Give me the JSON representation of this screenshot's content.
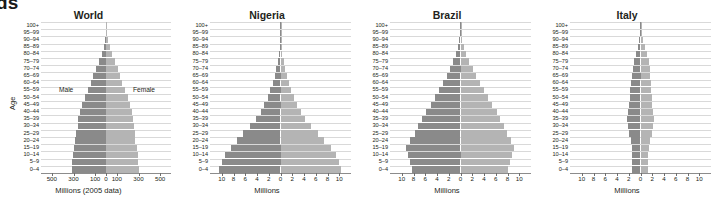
{
  "crop_fragment": "ds",
  "axis": {
    "y_title": "Age",
    "age_groups": [
      "100+",
      "95–99",
      "90–94",
      "85–89",
      "80–84",
      "75–79",
      "70–74",
      "65–69",
      "60–64",
      "55–59",
      "50–54",
      "45–49",
      "40–44",
      "35–39",
      "30–34",
      "25–29",
      "20–24",
      "15–19",
      "10–14",
      "5–9",
      "0–4"
    ]
  },
  "annotations": {
    "male": "Male",
    "female": "Female"
  },
  "colors": {
    "male_bar": "#8a8a8a",
    "female_bar": "#b4b4b4",
    "gridline": "#d9d9d9",
    "axis": "#6e6e6e",
    "text": "#231f20",
    "background": "#ffffff"
  },
  "chart_data": [
    {
      "type": "bar",
      "title": "World",
      "xlabel": "Millions (2005 data)",
      "ylabel": "Age",
      "xticks": [
        "500",
        "300",
        "100",
        "0",
        "100",
        "300",
        "500"
      ],
      "xtick_values": [
        -500,
        -300,
        -100,
        0,
        100,
        300,
        500
      ],
      "xlim": [
        -600,
        600
      ],
      "grid": true,
      "categories": [
        "100+",
        "95–99",
        "90–94",
        "85–89",
        "80–84",
        "75–79",
        "70–74",
        "65–69",
        "60–64",
        "55–59",
        "50–54",
        "45–49",
        "40–44",
        "35–39",
        "30–34",
        "25–29",
        "20–24",
        "15–19",
        "10–14",
        "5–9",
        "0–4"
      ],
      "series": [
        {
          "name": "Male",
          "values": [
            1,
            4,
            10,
            22,
            41,
            65,
            93,
            119,
            142,
            167,
            196,
            224,
            244,
            256,
            259,
            273,
            283,
            300,
            309,
            312,
            317
          ]
        },
        {
          "name": "Female",
          "values": [
            3,
            8,
            18,
            34,
            57,
            83,
            108,
            130,
            150,
            173,
            199,
            226,
            243,
            253,
            254,
            265,
            272,
            284,
            292,
            295,
            300
          ]
        }
      ]
    },
    {
      "type": "bar",
      "title": "Nigeria",
      "xlabel": "Millions",
      "ylabel": "Age",
      "xticks": [
        "10",
        "8",
        "6",
        "4",
        "2",
        "0",
        "2",
        "4",
        "6",
        "8",
        "10"
      ],
      "xtick_values": [
        -10,
        -8,
        -6,
        -4,
        -2,
        0,
        2,
        4,
        6,
        8,
        10
      ],
      "xlim": [
        -12,
        12
      ],
      "grid": true,
      "categories": [
        "100+",
        "95–99",
        "90–94",
        "85–89",
        "80–84",
        "75–79",
        "70–74",
        "65–69",
        "60–64",
        "55–59",
        "50–54",
        "45–49",
        "40–44",
        "35–39",
        "30–34",
        "25–29",
        "20–24",
        "15–19",
        "10–14",
        "5–9",
        "0–4"
      ],
      "series": [
        {
          "name": "Male",
          "values": [
            0.01,
            0.03,
            0.07,
            0.16,
            0.3,
            0.48,
            0.72,
            1.0,
            1.35,
            1.75,
            2.2,
            2.75,
            3.4,
            4.2,
            5.2,
            6.3,
            7.4,
            8.5,
            9.5,
            10.0,
            10.4
          ]
        },
        {
          "name": "Female",
          "values": [
            0.01,
            0.04,
            0.09,
            0.19,
            0.34,
            0.53,
            0.78,
            1.07,
            1.42,
            1.82,
            2.28,
            2.82,
            3.45,
            4.25,
            5.25,
            6.35,
            7.45,
            8.55,
            9.5,
            10.0,
            10.3
          ]
        }
      ]
    },
    {
      "type": "bar",
      "title": "Brazil",
      "xlabel": "Millions",
      "ylabel": "Age",
      "xticks": [
        "10",
        "8",
        "6",
        "4",
        "2",
        "0",
        "2",
        "4",
        "6",
        "8",
        "10"
      ],
      "xtick_values": [
        -10,
        -8,
        -6,
        -4,
        -2,
        0,
        2,
        4,
        6,
        8,
        10
      ],
      "xlim": [
        -12,
        12
      ],
      "grid": true,
      "categories": [
        "100+",
        "95–99",
        "90–94",
        "85–89",
        "80–84",
        "75–79",
        "70–74",
        "65–69",
        "60–64",
        "55–59",
        "50–54",
        "45–49",
        "40–44",
        "35–39",
        "30–34",
        "25–29",
        "20–24",
        "15–19",
        "10–14",
        "5–9",
        "0–4"
      ],
      "series": [
        {
          "name": "Male",
          "values": [
            0.02,
            0.08,
            0.2,
            0.42,
            0.78,
            1.2,
            1.75,
            2.35,
            2.95,
            3.6,
            4.3,
            5.1,
            5.9,
            6.6,
            7.2,
            7.8,
            8.6,
            9.3,
            9.0,
            8.6,
            8.3
          ]
        },
        {
          "name": "Female",
          "values": [
            0.04,
            0.13,
            0.3,
            0.6,
            1.0,
            1.5,
            2.1,
            2.7,
            3.3,
            3.95,
            4.65,
            5.4,
            6.15,
            6.8,
            7.4,
            7.95,
            8.6,
            9.1,
            8.8,
            8.4,
            8.0
          ]
        }
      ]
    },
    {
      "type": "bar",
      "title": "Italy",
      "xlabel": "Millions",
      "ylabel": "Age",
      "xticks": [
        "10",
        "8",
        "6",
        "4",
        "2",
        "0",
        "2",
        "4",
        "6",
        "8",
        "10"
      ],
      "xtick_values": [
        -10,
        -8,
        -6,
        -4,
        -2,
        0,
        2,
        4,
        6,
        8,
        10
      ],
      "xlim": [
        -12,
        12
      ],
      "grid": true,
      "categories": [
        "100+",
        "95–99",
        "90–94",
        "85–89",
        "80–84",
        "75–79",
        "70–74",
        "65–69",
        "60–64",
        "55–59",
        "50–54",
        "45–49",
        "40–44",
        "35–39",
        "30–34",
        "25–29",
        "20–24",
        "15–19",
        "10–14",
        "5–9",
        "0–4"
      ],
      "series": [
        {
          "name": "Male",
          "values": [
            0.01,
            0.06,
            0.19,
            0.42,
            0.78,
            1.08,
            1.35,
            1.5,
            1.62,
            1.72,
            1.82,
            1.95,
            2.2,
            2.35,
            2.2,
            1.95,
            1.65,
            1.45,
            1.4,
            1.38,
            1.42
          ]
        },
        {
          "name": "Female",
          "values": [
            0.03,
            0.16,
            0.4,
            0.75,
            1.15,
            1.4,
            1.55,
            1.62,
            1.72,
            1.8,
            1.88,
            1.98,
            2.18,
            2.3,
            2.15,
            1.9,
            1.6,
            1.38,
            1.33,
            1.3,
            1.35
          ]
        }
      ]
    }
  ]
}
